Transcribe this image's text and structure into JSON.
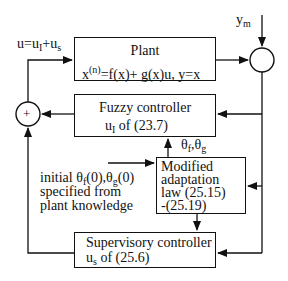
{
  "diagram": {
    "plant": {
      "title": "Plant",
      "equation_parts": {
        "x": "x",
        "sup_n": "(n)",
        "rest": "=f(x)+ g(x)u, y=x"
      }
    },
    "fuzzy_controller": {
      "title": "Fuzzy controller",
      "u": "u",
      "u_sub": "I",
      "ref": " of (23.7)"
    },
    "adaptation_law": {
      "line1": "Modified",
      "line2": "adaptation",
      "line3": "law (25.15)",
      "line4": "-(25.19)"
    },
    "supervisory_controller": {
      "title": "Supervisory controller",
      "u": "u",
      "u_sub": "s",
      "ref": " of (25.6)"
    },
    "control_signal_label": {
      "u_eq": "u=u",
      "sub1": "I",
      "plus": "+u",
      "sub2": "s"
    },
    "reference_input": {
      "y": "y",
      "sub": "m"
    },
    "parameters_label": {
      "t1": "θ",
      "s1": "f",
      "comma": ",θ",
      "s2": "g"
    },
    "initial_note": {
      "l1_a": "initial θ",
      "l1_s1": "f",
      "l1_b": "(0),θ",
      "l1_s2": "g",
      "l1_c": "(0)",
      "line2": "specified from",
      "line3": "plant knowledge"
    },
    "sum_left_symbol": "+",
    "colors": {
      "stroke": "#111111",
      "background": "#ffffff"
    }
  }
}
